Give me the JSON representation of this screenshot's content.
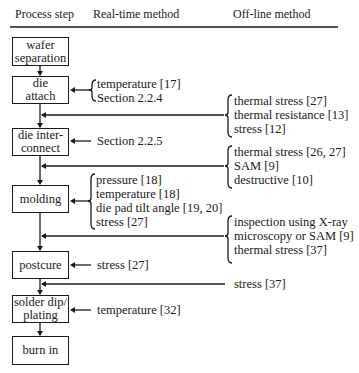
{
  "headers": {
    "process_step": "Process step",
    "real_time": "Real-time method",
    "off_line": "Off-line method"
  },
  "steps": [
    {
      "lines": [
        "wafer",
        "separation"
      ]
    },
    {
      "lines": [
        "die",
        "attach"
      ]
    },
    {
      "lines": [
        "die inter-",
        "connect"
      ]
    },
    {
      "lines": [
        "molding"
      ]
    },
    {
      "lines": [
        "postcure"
      ]
    },
    {
      "lines": [
        "solder dip/",
        "plating"
      ]
    },
    {
      "lines": [
        "burn in"
      ]
    }
  ],
  "real_time": {
    "die_attach": [
      "temperature [17]",
      "Section 2.2.4"
    ],
    "die_interconnect": [
      "Section 2.2.5"
    ],
    "molding": [
      "pressure [18]",
      "temperature [18]",
      "die pad tilt angle [19, 20]",
      "stress [27]"
    ],
    "postcure": [
      "stress [27]"
    ],
    "solder_dip": [
      "temperature [32]"
    ]
  },
  "off_line": {
    "after_die_attach": [
      "thermal stress [27]",
      "thermal resistance [13]",
      "stress [12]"
    ],
    "after_die_interconnect": [
      "thermal stress [26, 27]",
      "SAM [9]",
      "destructive [10]"
    ],
    "after_molding": [
      "inspection using X-ray",
      "microscopy or SAM [9]",
      "thermal stress [37]"
    ],
    "after_postcure": [
      "stress [37]"
    ]
  }
}
